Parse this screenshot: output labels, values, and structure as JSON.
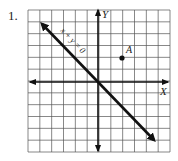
{
  "problem": {
    "number": "1."
  },
  "graph": {
    "grid": {
      "columns": 12,
      "rows": 12,
      "x_range": [
        -6,
        6
      ],
      "y_range": [
        -6,
        6
      ]
    },
    "axes": {
      "x_label": "X",
      "y_label": "Y"
    },
    "line": {
      "equation_label": "x + y = 0",
      "from": [
        -5,
        5
      ],
      "to": [
        5,
        -5
      ]
    },
    "point": {
      "label": "A",
      "coords": [
        2,
        2
      ]
    }
  }
}
